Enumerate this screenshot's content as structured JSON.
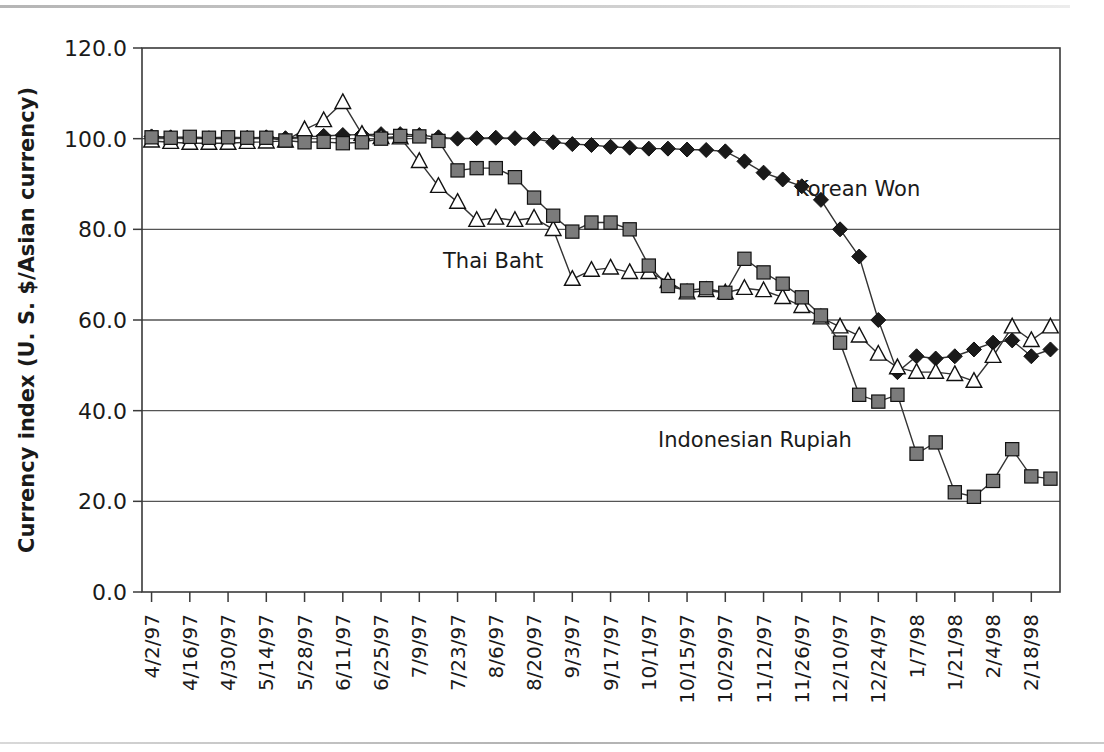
{
  "figure": {
    "background_color": "#ffffff",
    "plot_border_color": "#3a3a3a",
    "gridline_color": "#555555"
  },
  "axes": {
    "y_axis_title": "Currency index (U. S. $/Asian currency)",
    "y_ticks": [
      "0.0",
      "20.0",
      "40.0",
      "60.0",
      "80.0",
      "100.0",
      "120.0"
    ],
    "x_ticks": [
      "4/2/97",
      "4/16/97",
      "4/30/97",
      "5/14/97",
      "5/28/97",
      "6/11/97",
      "6/25/97",
      "7/9/97",
      "7/23/97",
      "8/6/97",
      "8/20/97",
      "9/3/97",
      "9/17/97",
      "10/1/97",
      "10/15/97",
      "10/29/97",
      "11/12/97",
      "11/26/97",
      "12/10/97",
      "12/24/97",
      "1/7/98",
      "1/21/98",
      "2/4/98",
      "2/18/98"
    ]
  },
  "annotations": [
    {
      "name": "korean-won-label",
      "text": "Korean Won"
    },
    {
      "name": "thai-baht-label",
      "text": "Thai Baht"
    },
    {
      "name": "indonesian-rupiah-label",
      "text": "Indonesian Rupiah"
    }
  ],
  "chart_data": {
    "type": "line",
    "title": "",
    "subtitle": "",
    "xlabel": "",
    "ylabel": "Currency index (U. S. $/Asian currency)",
    "ylim": [
      0.0,
      120.0
    ],
    "ytick_step": 20.0,
    "grid": "horizontal",
    "legend": "inline-annotations",
    "x": [
      "4/2/97",
      "4/9/97",
      "4/16/97",
      "4/23/97",
      "4/30/97",
      "5/7/97",
      "5/14/97",
      "5/21/97",
      "5/28/97",
      "6/4/97",
      "6/11/97",
      "6/18/97",
      "6/25/97",
      "7/2/97",
      "7/9/97",
      "7/16/97",
      "7/23/97",
      "7/30/97",
      "8/6/97",
      "8/13/97",
      "8/20/97",
      "8/27/97",
      "9/3/97",
      "9/10/97",
      "9/17/97",
      "9/24/97",
      "10/1/97",
      "10/8/97",
      "10/15/97",
      "10/22/97",
      "10/29/97",
      "11/5/97",
      "11/12/97",
      "11/19/97",
      "11/26/97",
      "12/3/97",
      "12/10/97",
      "12/17/97",
      "12/24/97",
      "12/31/97",
      "1/7/98",
      "1/14/98",
      "1/21/98",
      "1/28/98",
      "2/4/98",
      "2/11/98",
      "2/18/98",
      "2/25/98"
    ],
    "series": [
      {
        "name": "Korean Won",
        "marker": "filled-diamond",
        "marker_fill": "#1a1a1a",
        "line_color": "#333333",
        "values": [
          100.5,
          100.3,
          100.2,
          100.1,
          100.0,
          100.2,
          100.3,
          100.1,
          100.4,
          100.6,
          100.8,
          100.9,
          101.0,
          101.0,
          100.8,
          100.3,
          100.0,
          100.1,
          100.2,
          100.1,
          100.0,
          99.2,
          98.8,
          98.6,
          98.2,
          98.0,
          97.8,
          97.8,
          97.6,
          97.5,
          97.2,
          95.0,
          92.5,
          91.0,
          89.5,
          86.5,
          80.0,
          74.0,
          60.0,
          48.5,
          52.0,
          51.5,
          52.0,
          53.5,
          55.0,
          55.5,
          52.0,
          53.5
        ]
      },
      {
        "name": "Thai Baht",
        "marker": "open-triangle",
        "marker_fill": "#ffffff",
        "line_color": "#333333",
        "values": [
          99.5,
          99.2,
          99.0,
          99.0,
          99.0,
          99.2,
          99.3,
          99.5,
          102.0,
          104.0,
          108.0,
          101.0,
          100.3,
          100.2,
          95.0,
          89.5,
          86.0,
          82.0,
          82.5,
          82.0,
          82.5,
          80.0,
          69.0,
          71.0,
          71.5,
          70.5,
          70.5,
          68.5,
          66.0,
          66.5,
          66.0,
          67.0,
          66.5,
          65.0,
          63.0,
          60.5,
          58.5,
          56.5,
          52.5,
          49.5,
          48.5,
          48.5,
          48.0,
          46.5,
          52.0,
          58.5,
          55.5,
          58.5
        ]
      },
      {
        "name": "Indonesian Rupiah",
        "marker": "filled-square",
        "marker_fill": "#7b7b7b",
        "line_color": "#333333",
        "values": [
          100.3,
          100.2,
          100.4,
          100.2,
          100.3,
          100.2,
          100.2,
          99.6,
          99.2,
          99.3,
          99.0,
          99.2,
          100.0,
          100.6,
          100.5,
          99.5,
          93.0,
          93.5,
          93.5,
          91.5,
          87.0,
          83.0,
          79.5,
          81.5,
          81.5,
          80.0,
          72.0,
          67.5,
          66.5,
          67.0,
          66.0,
          73.5,
          70.5,
          68.0,
          65.0,
          61.0,
          55.0,
          43.5,
          42.0,
          43.5,
          30.5,
          33.0,
          22.0,
          21.0,
          24.5,
          31.5,
          25.5,
          25.0
        ]
      }
    ]
  }
}
